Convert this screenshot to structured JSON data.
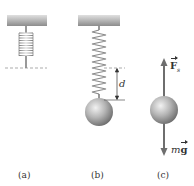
{
  "figure": {
    "panels": [
      {
        "id": "a",
        "caption": "(a)",
        "description": "Unstretched spring hanging from ceiling"
      },
      {
        "id": "b",
        "caption": "(b)",
        "description": "Spring stretched by hanging mass",
        "displacement_label": "d"
      },
      {
        "id": "c",
        "caption": "(c)",
        "description": "Free-body diagram of mass"
      }
    ],
    "forces": {
      "spring_force": {
        "symbol": "F",
        "subscript": "s"
      },
      "weight": {
        "prefix": "m",
        "symbol": "g"
      }
    },
    "colors": {
      "ceiling": "#9a9a9a",
      "spring": "#8a8a8a",
      "sphere": "#a8a8a8",
      "arrow": "#6e6e6e",
      "dashed_line": "#777777",
      "text": "#333333"
    }
  }
}
